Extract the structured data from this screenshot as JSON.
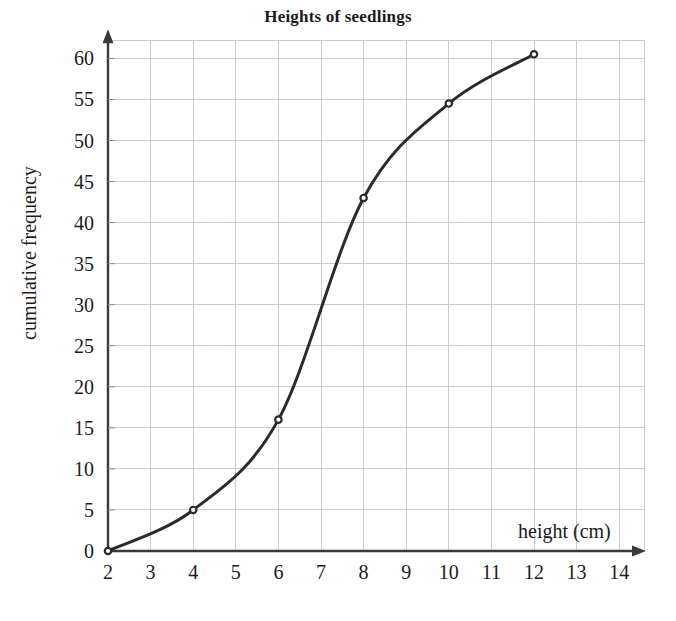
{
  "chart_data": {
    "type": "line",
    "title": "Heights of seedlings",
    "xlabel": "height (cm)",
    "ylabel": "cumulative frequency",
    "xlim": [
      2,
      14
    ],
    "ylim": [
      0,
      62
    ],
    "grid": true,
    "legend": "none",
    "x_ticks": [
      "2",
      "3",
      "4",
      "5",
      "6",
      "7",
      "8",
      "9",
      "10",
      "11",
      "12",
      "13",
      "14"
    ],
    "x_tick_values": [
      2,
      3,
      4,
      5,
      6,
      7,
      8,
      9,
      10,
      11,
      12,
      13,
      14
    ],
    "y_ticks": [
      "0",
      "5",
      "10",
      "15",
      "20",
      "25",
      "30",
      "35",
      "40",
      "45",
      "50",
      "55",
      "60"
    ],
    "y_tick_values": [
      0,
      5,
      10,
      15,
      20,
      25,
      30,
      35,
      40,
      45,
      50,
      55,
      60
    ],
    "series": [
      {
        "name": "cumulative frequency",
        "marker": "open-circle",
        "color": "#2b2b2b",
        "x": [
          2,
          4,
          6,
          8,
          10,
          12
        ],
        "values": [
          0,
          5,
          16,
          43,
          54.5,
          60.5
        ],
        "points": [
          {
            "x": 2,
            "y": 0
          },
          {
            "x": 4,
            "y": 5
          },
          {
            "x": 6,
            "y": 16
          },
          {
            "x": 8,
            "y": 43
          },
          {
            "x": 10,
            "y": 54.5
          },
          {
            "x": 12,
            "y": 60.5
          }
        ]
      }
    ],
    "colors": {
      "curve": "#2b2b2b",
      "grid": "#c9ccd6",
      "axis": "#3a3a3a",
      "text": "#1c1c1c",
      "background": "#ffffff"
    }
  }
}
